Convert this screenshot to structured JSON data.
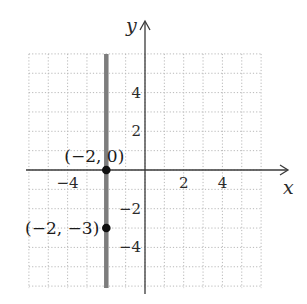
{
  "chart_data": {
    "type": "line",
    "title": "",
    "xlabel": "x",
    "ylabel": "y",
    "xlim": [
      -6,
      6
    ],
    "ylim": [
      -6,
      6
    ],
    "grid": true,
    "grid_step": 1,
    "x_ticks": [
      {
        "value": -4,
        "label": "−4"
      },
      {
        "value": 2,
        "label": "2"
      },
      {
        "value": 4,
        "label": "4"
      }
    ],
    "y_ticks": [
      {
        "value": 4,
        "label": "4"
      },
      {
        "value": 2,
        "label": "2"
      },
      {
        "value": -2,
        "label": "−2"
      },
      {
        "value": -4,
        "label": "−4"
      }
    ],
    "series": [
      {
        "name": "x = -2",
        "kind": "vertical-line",
        "x": [
          -2,
          -2
        ],
        "y": [
          -6,
          6
        ],
        "color": "#7d7d7d"
      }
    ],
    "points": [
      {
        "x": -2,
        "y": 0,
        "label": "(−2, 0)"
      },
      {
        "x": -2,
        "y": -3,
        "label": "(−2, −3)"
      }
    ]
  },
  "colors": {
    "grid": "#b8b8b8",
    "axis": "#3a3a3a",
    "line": "#7d7d7d",
    "point": "#111111"
  }
}
